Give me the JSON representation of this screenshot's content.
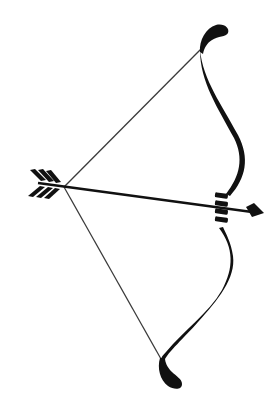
{
  "illustration": {
    "subject": "bow and arrow",
    "icons": [
      "bow-icon",
      "arrow-icon",
      "bowstring-icon",
      "arrow-fletching-icon",
      "arrowhead-icon",
      "grip-icon"
    ],
    "colors": {
      "background": "#ffffff",
      "ink": "#111111",
      "string": "#3a3a3a"
    }
  }
}
